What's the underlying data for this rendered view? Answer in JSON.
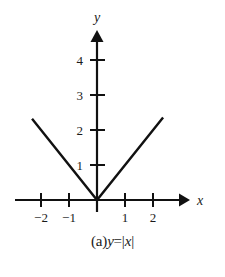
{
  "figure": {
    "caption_prefix": "(a)",
    "caption_function_y": "y",
    "caption_equals": "=|",
    "caption_var": "x",
    "caption_close": "|",
    "caption_full": "(a)y=|x|",
    "x_axis_label": "x",
    "y_axis_label": "y",
    "line_color": "#111111",
    "background_color": "#ffffff",
    "text_color": "#1a1a1a"
  },
  "chart_data": {
    "type": "line",
    "title": "(a)y=|x|",
    "xlabel": "x",
    "ylabel": "y",
    "xlim": [
      -2.9,
      3.1
    ],
    "ylim": [
      -0.35,
      4.85
    ],
    "grid": false,
    "legend": null,
    "xticks": [
      -2,
      -1,
      1,
      2
    ],
    "xtick_labels": [
      "−2",
      "−1",
      "1",
      "2"
    ],
    "yticks": [
      1,
      2,
      3,
      4
    ],
    "ytick_labels": [
      "1",
      "2",
      "3",
      "4"
    ],
    "series": [
      {
        "name": "y=|x|",
        "equation": "y = |x|",
        "x": [
          -2.32,
          0,
          2.36
        ],
        "y": [
          2.32,
          0,
          2.36
        ]
      }
    ]
  }
}
